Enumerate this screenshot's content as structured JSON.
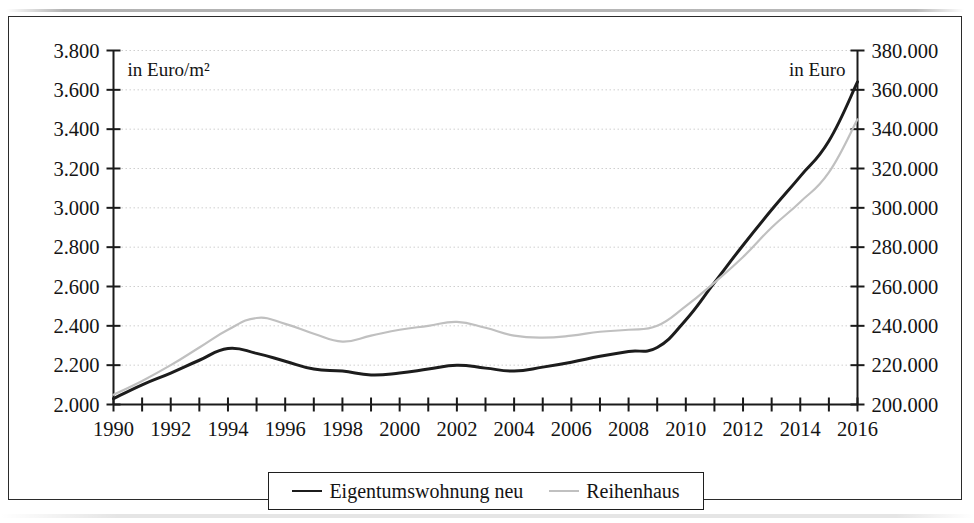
{
  "figure": {
    "left_annotation": "in Euro/m²",
    "right_annotation": "in Euro"
  },
  "legend": {
    "entries": [
      {
        "label": "Eigentumswohnung neu",
        "color": "#1c1c1c",
        "style": "solid-dark"
      },
      {
        "label": "Reihenhaus",
        "color": "#c0c0c0",
        "style": "solid-light"
      }
    ]
  },
  "chart_data": {
    "type": "line",
    "title": "",
    "subtitle": "",
    "xlabel": "",
    "ylabel": "in Euro/m²",
    "y2label": "in Euro",
    "grid": true,
    "legend_position": "bottom",
    "x": [
      1990,
      1991,
      1992,
      1993,
      1994,
      1995,
      1996,
      1997,
      1998,
      1999,
      2000,
      2001,
      2002,
      2003,
      2004,
      2005,
      2006,
      2007,
      2008,
      2009,
      2010,
      2011,
      2012,
      2013,
      2014,
      2015,
      2016
    ],
    "xlim": [
      1990,
      2016
    ],
    "xticks": [
      1990,
      1991,
      1992,
      1993,
      1994,
      1995,
      1996,
      1997,
      1998,
      1999,
      2000,
      2001,
      2002,
      2003,
      2004,
      2005,
      2006,
      2007,
      2008,
      2009,
      2010,
      2011,
      2012,
      2013,
      2014,
      2015,
      2016
    ],
    "xtick_labels": [
      "1990",
      "",
      "1992",
      "",
      "1994",
      "",
      "1996",
      "",
      "1998",
      "",
      "2000",
      "",
      "2002",
      "",
      "2004",
      "",
      "2006",
      "",
      "2008",
      "",
      "2010",
      "",
      "2012",
      "",
      "2014",
      "",
      "2016"
    ],
    "ylim": [
      2000,
      3800
    ],
    "yticks": [
      2000,
      2200,
      2400,
      2600,
      2800,
      3000,
      3200,
      3400,
      3600,
      3800
    ],
    "ytick_labels": [
      "2.000",
      "2.200",
      "2.400",
      "2.600",
      "2.800",
      "3.000",
      "3.200",
      "3.400",
      "3.600",
      "3.800"
    ],
    "y2lim": [
      200000,
      380000
    ],
    "y2ticks": [
      200000,
      220000,
      240000,
      260000,
      280000,
      300000,
      320000,
      340000,
      360000,
      380000
    ],
    "y2tick_labels": [
      "200.000",
      "220.000",
      "240.000",
      "260.000",
      "280.000",
      "300.000",
      "320.000",
      "340.000",
      "360.000",
      "380.000"
    ],
    "series": [
      {
        "name": "Eigentumswohnung neu",
        "axis": "left",
        "unit": "Euro/m²",
        "color": "#1c1c1c",
        "values": [
          2030,
          2100,
          2160,
          2225,
          2285,
          2260,
          2220,
          2180,
          2170,
          2150,
          2160,
          2180,
          2200,
          2185,
          2170,
          2190,
          2215,
          2245,
          2270,
          2290,
          2430,
          2620,
          2810,
          2990,
          3160,
          3340,
          3640
        ]
      },
      {
        "name": "Reihenhaus",
        "axis": "right",
        "unit": "Euro",
        "color": "#c0c0c0",
        "values": [
          205000,
          212000,
          220000,
          229000,
          238000,
          244000,
          241000,
          236000,
          232000,
          235000,
          238000,
          240000,
          242000,
          239000,
          235000,
          234000,
          235000,
          237000,
          238000,
          240000,
          250000,
          262000,
          275000,
          290000,
          303000,
          318000,
          345000
        ]
      }
    ]
  }
}
